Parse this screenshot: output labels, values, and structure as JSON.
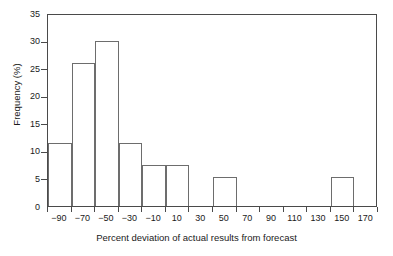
{
  "chart_data": {
    "type": "bar",
    "title": "",
    "xlabel": "Percent deviation of actual results from forecast",
    "ylabel": "Frequency (%)",
    "categories": [
      "-90",
      "-70",
      "-50",
      "-30",
      "-10",
      "10",
      "30",
      "50",
      "70",
      "90",
      "110",
      "130",
      "150",
      "170"
    ],
    "bin_edges": [
      -100,
      -80,
      -60,
      -40,
      -20,
      0,
      20,
      40,
      60,
      80,
      100,
      120,
      140,
      160,
      180
    ],
    "values": [
      11.5,
      26.0,
      30.0,
      11.5,
      7.5,
      7.5,
      0,
      5.3,
      0,
      0,
      0,
      0,
      5.3,
      0
    ],
    "xlim": [
      -100,
      180
    ],
    "ylim": [
      0,
      35
    ],
    "ytick_labels": [
      "0",
      "5",
      "10",
      "15",
      "20",
      "25",
      "30",
      "35"
    ],
    "ytick_values": [
      0,
      5,
      10,
      15,
      20,
      25,
      30,
      35
    ],
    "xtick_labels": [
      "-90",
      "-70",
      "-50",
      "-30",
      "-10",
      "10",
      "30",
      "50",
      "70",
      "90",
      "110",
      "130",
      "150",
      "170"
    ],
    "grid": false,
    "legend": null,
    "bar_edge_color": "#6d6d6d",
    "bar_fill_color": "none",
    "axis_color": "#4a4a4a",
    "background_color": "#ffffff"
  }
}
